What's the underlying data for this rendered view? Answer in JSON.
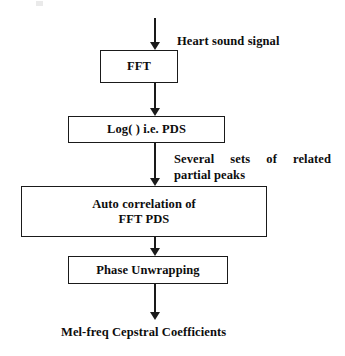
{
  "diagram": {
    "orientation": "top-to-bottom",
    "stroke_color": "#1a1a1a",
    "text_color": "#0d0d0d",
    "background_color": "#ffffff",
    "boxes": [
      {
        "id": "fft",
        "label": "FFT"
      },
      {
        "id": "log",
        "label": "Log( ) i.e. PDS"
      },
      {
        "id": "autocorr",
        "label_line1": "Auto correlation of",
        "label_line2": "FFT PDS"
      },
      {
        "id": "phase",
        "label": "Phase Unwrapping"
      }
    ],
    "annotations": {
      "input_label": "Heart sound signal",
      "peaks_label_line1": "Several sets of related",
      "peaks_label_line2": "partial peaks",
      "output_label": "Mel-freq Cepstral Coefficients"
    },
    "arrows": [
      {
        "id": "input",
        "from": "input-signal",
        "to": "fft"
      },
      {
        "id": "fft-log",
        "from": "fft",
        "to": "log"
      },
      {
        "id": "log-auto",
        "from": "log",
        "to": "autocorr"
      },
      {
        "id": "auto-phase",
        "from": "autocorr",
        "to": "phase"
      },
      {
        "id": "phase-out",
        "from": "phase",
        "to": "output"
      }
    ]
  }
}
